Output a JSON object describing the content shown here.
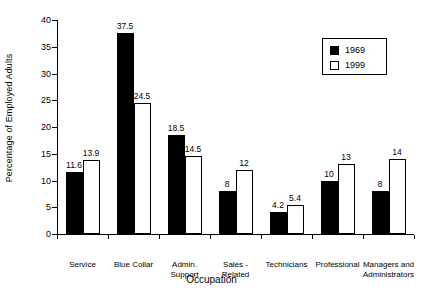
{
  "chart_data": {
    "type": "bar",
    "title": "",
    "subtitle": "",
    "xlabel": "Occupation",
    "ylabel": "Percentage of Employed Adults",
    "ylim": [
      0,
      40
    ],
    "yticks": [
      0,
      5,
      10,
      15,
      20,
      25,
      30,
      35,
      40
    ],
    "ytick_labels": [
      "0",
      "5",
      "10",
      "15",
      "20",
      "25",
      "30",
      "35",
      "40"
    ],
    "grid": false,
    "legend_position": "top-right",
    "categories": [
      "Service",
      "Blue Collar",
      "Admin.\nSupport",
      "Sales -\nRelated",
      "Technicians",
      "Professional",
      "Managers and\nAdministrators"
    ],
    "series": [
      {
        "name": "1969",
        "color": "#000000",
        "fill": "solid",
        "values": [
          11.6,
          37.5,
          18.5,
          8,
          4.2,
          10,
          8
        ],
        "value_labels": [
          "11.6",
          "37.5",
          "18.5",
          "8",
          "4.2",
          "10",
          "8"
        ]
      },
      {
        "name": "1999",
        "color": "#ffffff",
        "fill": "hollow",
        "values": [
          13.9,
          24.5,
          14.5,
          12,
          5.4,
          13,
          14
        ],
        "value_labels": [
          "13.9",
          "24.5",
          "14.5",
          "12",
          "5.4",
          "13",
          "14"
        ]
      }
    ]
  },
  "legend": {
    "entries": [
      {
        "label": "1969",
        "swatch": "filled"
      },
      {
        "label": "1999",
        "swatch": "hollow"
      }
    ]
  },
  "axes": {
    "y_title": "Percentage of Employed Adults",
    "x_title": "Occupation"
  }
}
